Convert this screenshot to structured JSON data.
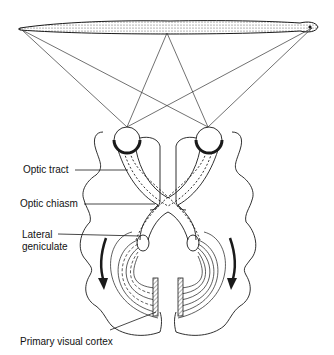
{
  "diagram": {
    "labels": {
      "optic_tract": "Optic tract",
      "optic_chiasm": "Optic chiasm",
      "lateral_geniculate_line1": "Lateral",
      "lateral_geniculate_line2": "geniculate",
      "primary_visual_cortex": "Primary visual cortex"
    },
    "colors": {
      "ink": "#1a1a1a",
      "background": "#ffffff",
      "hatch": "#777777"
    }
  }
}
